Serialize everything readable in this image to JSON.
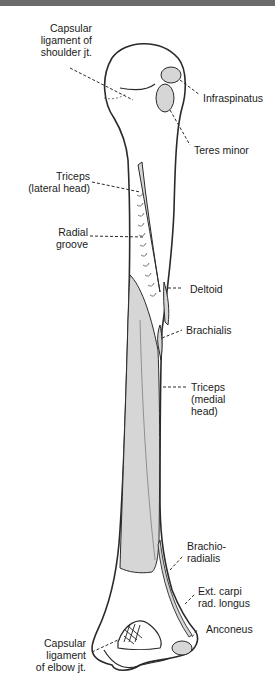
{
  "figure": {
    "colors": {
      "bone_fill": "#ffffff",
      "outline": "#2a2a2a",
      "attachment_fill": "#d6d6d6",
      "top_bar": "#6b6b6b"
    }
  },
  "labels": {
    "capsular_shoulder": "Capsular\nligament of\nshoulder jt.",
    "infraspinatus": "Infraspinatus",
    "teres_minor": "Teres minor",
    "triceps_lateral": "Triceps\n(lateral head)",
    "radial_groove": "Radial\ngroove",
    "deltoid": "Deltoid",
    "brachialis": "Brachialis",
    "triceps_medial": "Triceps\n(medial\nhead)",
    "brachioradialis": "Brachio-\nradialis",
    "ext_carpi": "Ext. carpi\nrad. longus",
    "anconeus": "Anconeus",
    "capsular_elbow": "Capsular\nligament\nof elbow jt."
  }
}
